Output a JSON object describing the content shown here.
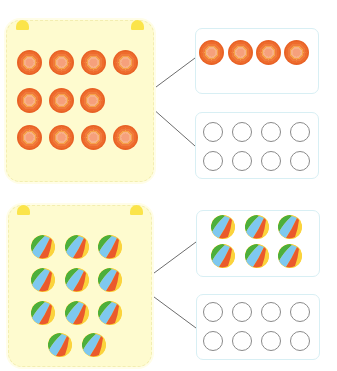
{
  "exercise": {
    "groups": [
      {
        "id": "flowers",
        "item_type": "flower-icon",
        "source_count": 11,
        "source_rows": [
          4,
          3,
          4
        ],
        "options": [
          {
            "type": "filled",
            "count": 4,
            "rows": [
              4
            ]
          },
          {
            "type": "empty-circles",
            "count": 8,
            "rows": [
              4,
              4
            ]
          }
        ]
      },
      {
        "id": "balls",
        "item_type": "beach-ball-icon",
        "source_count": 11,
        "source_rows": [
          3,
          3,
          3,
          2
        ],
        "options": [
          {
            "type": "filled",
            "count": 6,
            "rows": [
              3,
              3
            ]
          },
          {
            "type": "empty-circles",
            "count": 8,
            "rows": [
              4,
              4
            ]
          }
        ]
      }
    ]
  },
  "colors": {
    "card_bg": "#fefbcf",
    "ear": "#fbe44a",
    "answer_border": "#d8eff4",
    "connector_line": "#6d6d6d",
    "flower_outer": "#e86226",
    "flower_center": "#f6a07c",
    "ball_green": "#4caf3c",
    "ball_blue": "#7ec8ef",
    "ball_red": "#ea5a2c",
    "ball_yellow": "#fbd33c",
    "empty_circle": "#8a8a8a"
  }
}
